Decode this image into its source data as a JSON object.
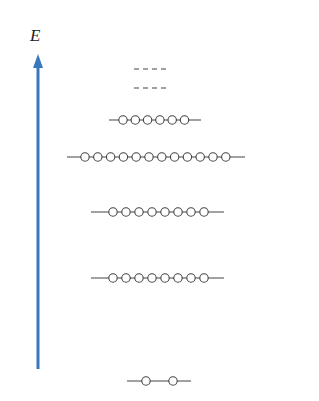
{
  "diagram": {
    "axis": {
      "label": "E",
      "color": "#3a78be",
      "x": 38,
      "y_top": 54,
      "y_bottom": 369
    },
    "line_color": "#444444",
    "circle_radius": 4.2,
    "levels": [
      {
        "name": "ground",
        "y": 381,
        "x_start": 127,
        "x_end": 191,
        "electrons": 2,
        "circle_x": [
          146,
          173
        ],
        "dashed": false
      },
      {
        "name": "level-2",
        "y": 278,
        "x_start": 91,
        "x_end": 224,
        "electrons": 8,
        "spacing": 13,
        "first_x": 113,
        "dashed": false
      },
      {
        "name": "level-3",
        "y": 212,
        "x_start": 91,
        "x_end": 224,
        "electrons": 8,
        "spacing": 13,
        "first_x": 113,
        "dashed": false
      },
      {
        "name": "level-4",
        "y": 157,
        "x_start": 67,
        "x_end": 245,
        "electrons": 12,
        "spacing": 12.8,
        "first_x": 85,
        "dashed": false
      },
      {
        "name": "level-5",
        "y": 120,
        "x_start": 109,
        "x_end": 201,
        "electrons": 6,
        "spacing": 12.3,
        "first_x": 123,
        "dashed": false
      },
      {
        "name": "level-6",
        "y": 88,
        "x_start": 134,
        "x_end": 170,
        "electrons": 0,
        "dashed": true
      },
      {
        "name": "level-7",
        "y": 69,
        "x_start": 134,
        "x_end": 170,
        "electrons": 0,
        "dashed": true
      }
    ]
  }
}
